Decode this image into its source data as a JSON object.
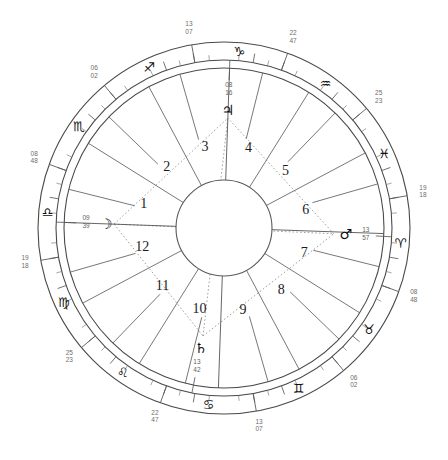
{
  "chart_data": {
    "type": "wheel",
    "radii": {
      "outer": 186,
      "zodiac_inner": 168,
      "house_ring": 160,
      "center": 48
    },
    "center": {
      "cx": 224,
      "cy": 228
    },
    "house_numbers": [
      "1",
      "2",
      "3",
      "4",
      "5",
      "6",
      "7",
      "8",
      "9",
      "10",
      "11",
      "12"
    ],
    "zodiac_signs": [
      {
        "name": "Aries",
        "glyph": "♈",
        "cusp_deg": "19",
        "cusp_min": "18",
        "angle": 355
      },
      {
        "name": "Taurus",
        "glyph": "♉",
        "cusp_deg": "08",
        "cusp_min": "48",
        "angle": 325
      },
      {
        "name": "Gemini",
        "glyph": "♊",
        "cusp_deg": "06",
        "cusp_min": "02",
        "angle": 295
      },
      {
        "name": "Cancer",
        "glyph": "♋",
        "cusp_deg": "13",
        "cusp_min": "07",
        "angle": 265
      },
      {
        "name": "Leo",
        "glyph": "♌",
        "cusp_deg": "22",
        "cusp_min": "47",
        "angle": 235
      },
      {
        "name": "Virgo",
        "glyph": "♍",
        "cusp_deg": "25",
        "cusp_min": "23",
        "angle": 205
      },
      {
        "name": "Libra",
        "glyph": "♎",
        "cusp_deg": "19",
        "cusp_min": "18",
        "angle": 175
      },
      {
        "name": "Scorpio",
        "glyph": "♏",
        "cusp_deg": "08",
        "cusp_min": "48",
        "angle": 145
      },
      {
        "name": "Sagittarius",
        "glyph": "♐",
        "cusp_deg": "06",
        "cusp_min": "02",
        "angle": 115
      },
      {
        "name": "Capricorn",
        "glyph": "♑",
        "cusp_deg": "13",
        "cusp_min": "07",
        "angle": 85
      },
      {
        "name": "Aquarius",
        "glyph": "♒",
        "cusp_deg": "22",
        "cusp_min": "47",
        "angle": 55
      },
      {
        "name": "Pisces",
        "glyph": "♓",
        "cusp_deg": "25",
        "cusp_min": "23",
        "angle": 25
      }
    ],
    "planets": [
      {
        "name": "Moon",
        "glyph": "☽",
        "deg": "09",
        "min": "39",
        "angle": 178,
        "radius": 118
      },
      {
        "name": "Saturn",
        "glyph": "♄",
        "deg": "13",
        "min": "42",
        "angle": 259,
        "radius": 122
      },
      {
        "name": "Mars",
        "glyph": "♂",
        "deg": "13",
        "min": "57",
        "angle": 357,
        "radius": 122
      },
      {
        "name": "Jupiter",
        "glyph": "♃",
        "deg": "08",
        "min": "16",
        "angle": 88,
        "radius": 118
      }
    ],
    "aspect_lines": [
      {
        "from_angle": 178,
        "to_angle": 357,
        "style": "dotted"
      },
      {
        "from_angle": 178,
        "to_angle": 259,
        "style": "dotted"
      },
      {
        "from_angle": 178,
        "to_angle": 88,
        "style": "dotted"
      },
      {
        "from_angle": 259,
        "to_angle": 88,
        "style": "dotted"
      },
      {
        "from_angle": 357,
        "to_angle": 88,
        "style": "dotted"
      },
      {
        "from_angle": 259,
        "to_angle": 357,
        "style": "dotted"
      }
    ],
    "colors": {
      "ink": "#1b1b1b",
      "rule": "#5a5a5a",
      "faint": "#8a8a8a",
      "degree_label": "#6d6d6d",
      "background": "#ffffff"
    }
  }
}
